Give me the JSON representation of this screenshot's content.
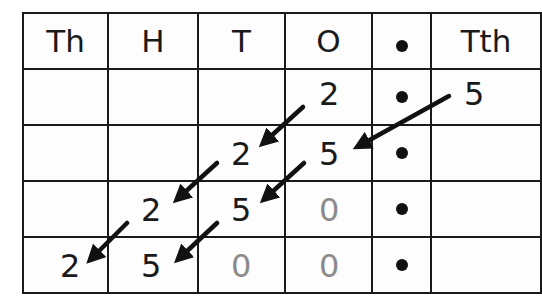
{
  "diagram": {
    "columns": [
      {
        "key": "th",
        "label": "Th"
      },
      {
        "key": "h",
        "label": "H"
      },
      {
        "key": "t",
        "label": "T"
      },
      {
        "key": "o",
        "label": "O"
      },
      {
        "key": "dp",
        "label": "•"
      },
      {
        "key": "tth",
        "label": "Tth"
      }
    ],
    "rows": [
      {
        "th": "",
        "h": "",
        "t": "",
        "o": "2",
        "dp": "•",
        "tth": "5"
      },
      {
        "th": "",
        "h": "",
        "t": "2",
        "o": "5",
        "dp": "•",
        "tth": ""
      },
      {
        "th": "",
        "h": "2",
        "t": "5",
        "o": "0",
        "dp": "•",
        "tth": ""
      },
      {
        "th": "2",
        "h": "5",
        "t": "0",
        "o": "0",
        "dp": "•",
        "tth": ""
      }
    ],
    "placeholder_zeros": [
      {
        "row": 2,
        "col": "o"
      },
      {
        "row": 3,
        "col": "t"
      },
      {
        "row": 3,
        "col": "o"
      }
    ],
    "arrows": [
      {
        "from": "row0.tth",
        "to": "row1.o"
      },
      {
        "from": "row0.o",
        "to": "row1.t"
      },
      {
        "from": "row1.t",
        "to": "row2.h"
      },
      {
        "from": "row1.o",
        "to": "row2.t"
      },
      {
        "from": "row2.h",
        "to": "row3.th"
      },
      {
        "from": "row2.t",
        "to": "row3.h"
      }
    ],
    "colors": {
      "line": "#1a1a1a",
      "digit": "#1a1a1a",
      "placeholder_zero": "#8a8a8a",
      "arrow": "#111111",
      "background": "#fdfdfd"
    }
  }
}
